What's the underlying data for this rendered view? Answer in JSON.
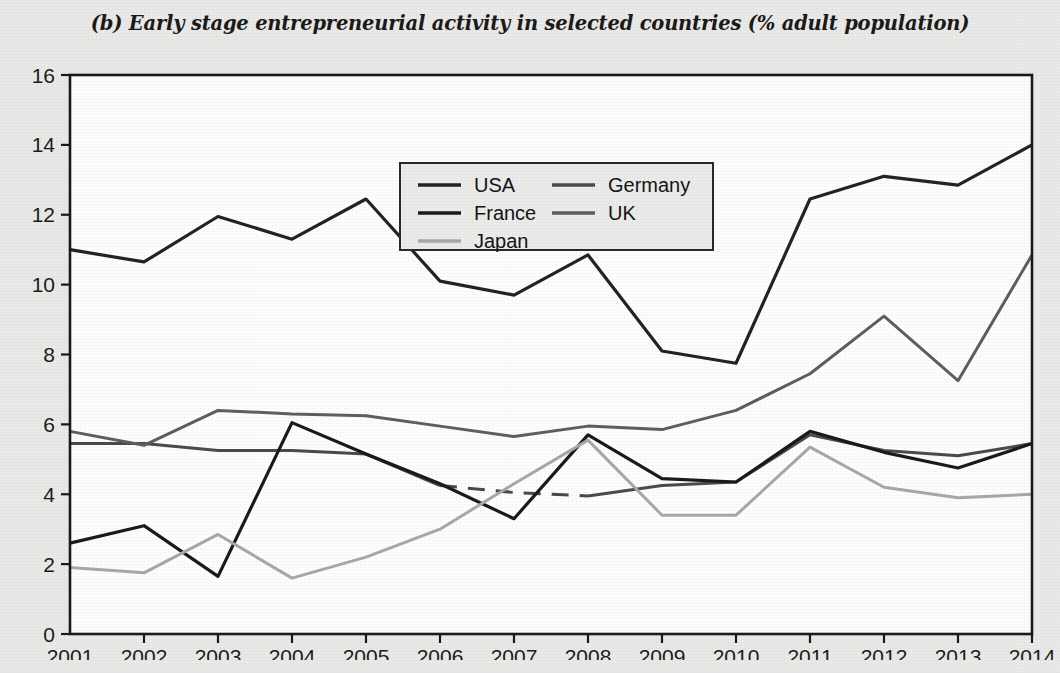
{
  "chart_data": {
    "type": "line",
    "title": "(b) Early stage entrepreneurial activity in selected countries (% adult population)",
    "xlabel": "",
    "ylabel": "",
    "x": [
      2001,
      2002,
      2003,
      2004,
      2005,
      2006,
      2007,
      2008,
      2009,
      2010,
      2011,
      2012,
      2013,
      2014
    ],
    "categories": [
      "2001",
      "2002",
      "2003",
      "2004",
      "2005",
      "2006",
      "2007",
      "2008",
      "2009",
      "2010",
      "2011",
      "2012",
      "2013",
      "2014"
    ],
    "xlim": [
      2001,
      2014
    ],
    "ylim": [
      0,
      16
    ],
    "yticks": [
      0,
      2,
      4,
      6,
      8,
      10,
      12,
      14,
      16
    ],
    "ytick_labels": [
      "0",
      "2",
      "4",
      "6",
      "8",
      "10",
      "12",
      "14",
      "16"
    ],
    "grid": false,
    "legend_position": "top-center",
    "series": [
      {
        "name": "USA",
        "color": "#232323",
        "width": 3.2,
        "dashed_from": null,
        "values": [
          11.0,
          10.65,
          11.95,
          11.3,
          12.45,
          10.1,
          9.7,
          10.85,
          8.1,
          7.75,
          12.45,
          13.1,
          12.85,
          14.0
        ]
      },
      {
        "name": "Germany",
        "color": "#4a4a4a",
        "width": 3.0,
        "dashed_segment": [
          2006,
          2008
        ],
        "values": [
          5.45,
          5.45,
          5.25,
          5.25,
          5.15,
          4.25,
          4.05,
          3.95,
          4.25,
          4.35,
          5.7,
          5.25,
          5.1,
          5.45
        ]
      },
      {
        "name": "France",
        "color": "#1a1a1a",
        "width": 3.2,
        "dashed_from": null,
        "values": [
          2.6,
          3.1,
          1.65,
          6.05,
          5.15,
          4.3,
          3.3,
          5.7,
          4.45,
          4.35,
          5.8,
          5.2,
          4.75,
          5.45
        ]
      },
      {
        "name": "UK",
        "color": "#5e5e5e",
        "width": 3.0,
        "dashed_from": null,
        "values": [
          5.8,
          5.4,
          6.4,
          6.3,
          6.25,
          5.95,
          5.65,
          5.95,
          5.85,
          6.4,
          7.45,
          9.1,
          7.25,
          10.85
        ]
      },
      {
        "name": "Japan",
        "color": "#a8a8a8",
        "width": 3.0,
        "dashed_from": null,
        "values": [
          1.9,
          1.75,
          2.85,
          1.6,
          2.2,
          3.0,
          4.3,
          5.55,
          3.4,
          3.4,
          5.35,
          4.2,
          3.9,
          4.0
        ]
      }
    ],
    "legend_entries": [
      {
        "label": "USA",
        "color": "#232323"
      },
      {
        "label": "Germany",
        "color": "#4a4a4a"
      },
      {
        "label": "France",
        "color": "#1a1a1a"
      },
      {
        "label": "UK",
        "color": "#5e5e5e"
      },
      {
        "label": "Japan",
        "color": "#a8a8a8"
      }
    ]
  },
  "axis": {
    "frame_color": "#1a1a1a",
    "plot_background": "#fdfdfd"
  }
}
